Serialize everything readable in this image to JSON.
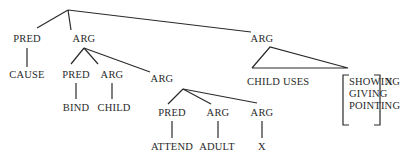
{
  "diagram": {
    "root": {
      "children": [
        "PRED",
        "ARG",
        "ARG"
      ]
    },
    "level1": {
      "pred": "PRED",
      "arg": "ARG",
      "arg_right": "ARG"
    },
    "level2": {
      "cause": "CAUSE",
      "pred": "PRED",
      "arg": "ARG",
      "arg_embedded": "ARG"
    },
    "level3": {
      "bind": "BIND",
      "child": "CHILD",
      "pred": "PRED",
      "arg": "ARG",
      "arg_x": "ARG"
    },
    "level4": {
      "attend": "ATTEND",
      "adult": "ADULT",
      "x": "X"
    },
    "right_branch": {
      "phrase": "CHILD USES",
      "options": [
        "SHOWING",
        "GIVING",
        "POINTING"
      ],
      "trailing": "X"
    }
  }
}
